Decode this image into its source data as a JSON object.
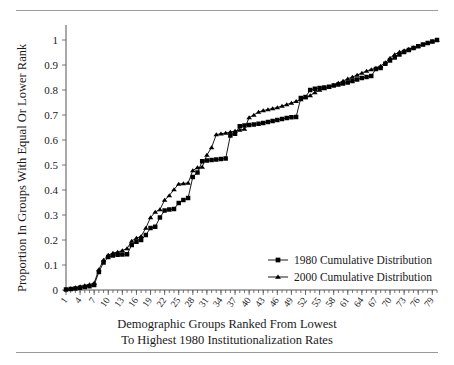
{
  "chart_data": {
    "type": "line",
    "title": "",
    "xlabel": "Demographic Groups Ranked From Lowest To Highest 1980 Institutionalization Rates",
    "xlabel_line1": "Demographic Groups Ranked From Lowest",
    "xlabel_line2": "To Highest 1980 Institutionalization Rates",
    "ylabel": "Proportion In Groups With Equal Or Lower Rank",
    "xlim": [
      1,
      80
    ],
    "ylim": [
      0,
      1
    ],
    "grid": false,
    "legend_position": "center-right",
    "ytick_labels": [
      "0",
      "0.1",
      "0.2",
      "0.3",
      "0.4",
      "0.5",
      "0.6",
      "0.7",
      "0.8",
      "0.9",
      "1"
    ],
    "ytick_values": [
      0,
      0.1,
      0.2,
      0.3,
      0.4,
      0.5,
      0.6,
      0.7,
      0.8,
      0.9,
      1
    ],
    "xtick_labels": [
      "1",
      "4",
      "7",
      "10",
      "13",
      "16",
      "19",
      "22",
      "25",
      "28",
      "31",
      "34",
      "37",
      "40",
      "43",
      "46",
      "49",
      "52",
      "55",
      "58",
      "61",
      "64",
      "67",
      "70",
      "73",
      "76",
      "79"
    ],
    "xtick_values": [
      1,
      4,
      7,
      10,
      13,
      16,
      19,
      22,
      25,
      28,
      31,
      34,
      37,
      40,
      43,
      46,
      49,
      52,
      55,
      58,
      61,
      64,
      67,
      70,
      73,
      76,
      79
    ],
    "x": [
      1,
      2,
      3,
      4,
      5,
      6,
      7,
      8,
      9,
      10,
      11,
      12,
      13,
      14,
      15,
      16,
      17,
      18,
      19,
      20,
      21,
      22,
      23,
      24,
      25,
      26,
      27,
      28,
      29,
      30,
      31,
      32,
      33,
      34,
      35,
      36,
      37,
      38,
      39,
      40,
      41,
      42,
      43,
      44,
      45,
      46,
      47,
      48,
      49,
      50,
      51,
      52,
      53,
      54,
      55,
      56,
      57,
      58,
      59,
      60,
      61,
      62,
      63,
      64,
      65,
      66,
      67,
      68,
      69,
      70,
      71,
      72,
      73,
      74,
      75,
      76,
      77,
      78,
      79,
      80
    ],
    "series": [
      {
        "name": "1980 Cumulative Distribution",
        "marker": "square",
        "values": [
          0.002,
          0.004,
          0.006,
          0.009,
          0.012,
          0.015,
          0.02,
          0.072,
          0.11,
          0.132,
          0.138,
          0.141,
          0.142,
          0.143,
          0.18,
          0.193,
          0.2,
          0.22,
          0.248,
          0.253,
          0.29,
          0.318,
          0.322,
          0.324,
          0.348,
          0.36,
          0.368,
          0.452,
          0.47,
          0.515,
          0.518,
          0.52,
          0.522,
          0.524,
          0.526,
          0.618,
          0.625,
          0.655,
          0.658,
          0.66,
          0.662,
          0.665,
          0.668,
          0.672,
          0.676,
          0.68,
          0.684,
          0.688,
          0.691,
          0.692,
          0.768,
          0.772,
          0.8,
          0.805,
          0.808,
          0.81,
          0.813,
          0.818,
          0.822,
          0.826,
          0.83,
          0.836,
          0.842,
          0.848,
          0.852,
          0.856,
          0.884,
          0.888,
          0.905,
          0.918,
          0.93,
          0.942,
          0.952,
          0.96,
          0.968,
          0.975,
          0.982,
          0.988,
          0.994,
          1.0
        ]
      },
      {
        "name": "2000 Cumulative Distribution",
        "marker": "triangle",
        "values": [
          0.003,
          0.006,
          0.01,
          0.014,
          0.018,
          0.022,
          0.028,
          0.082,
          0.12,
          0.14,
          0.148,
          0.152,
          0.158,
          0.166,
          0.196,
          0.208,
          0.215,
          0.248,
          0.29,
          0.312,
          0.322,
          0.36,
          0.378,
          0.402,
          0.424,
          0.426,
          0.428,
          0.478,
          0.49,
          0.492,
          0.54,
          0.57,
          0.622,
          0.625,
          0.628,
          0.632,
          0.636,
          0.64,
          0.644,
          0.69,
          0.7,
          0.712,
          0.718,
          0.722,
          0.726,
          0.73,
          0.736,
          0.742,
          0.748,
          0.755,
          0.762,
          0.77,
          0.778,
          0.79,
          0.8,
          0.806,
          0.812,
          0.82,
          0.828,
          0.836,
          0.845,
          0.852,
          0.86,
          0.868,
          0.876,
          0.882,
          0.888,
          0.896,
          0.91,
          0.928,
          0.942,
          0.952,
          0.958,
          0.964,
          0.97,
          0.976,
          0.982,
          0.988,
          0.994,
          1.0
        ]
      }
    ]
  },
  "legend": {
    "entries": [
      {
        "label": "1980 Cumulative Distribution",
        "marker": "square"
      },
      {
        "label": "2000 Cumulative Distribution",
        "marker": "triangle"
      }
    ]
  }
}
